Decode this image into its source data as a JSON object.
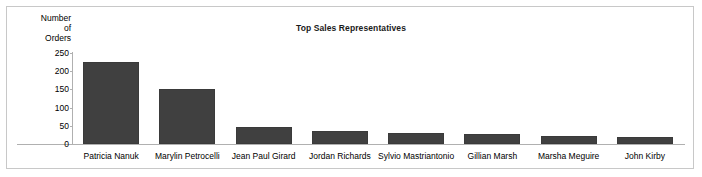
{
  "chart_data": {
    "type": "bar",
    "title": "Top Sales Representatives",
    "xlabel": "",
    "ylabel": "Number of Orders",
    "ylabel_lines": [
      "Number",
      "of",
      "Orders"
    ],
    "categories": [
      "Patricia Nanuk",
      "Marylin Petrocelli",
      "Jean Paul Girard",
      "Jordan Richards",
      "Sylvio Mastriantonio",
      "Gillian Marsh",
      "Marsha Meguire",
      "John Kirby"
    ],
    "values": [
      225,
      150,
      48,
      35,
      30,
      27,
      23,
      18
    ],
    "ylim": [
      0,
      250
    ],
    "yticks": [
      0,
      50,
      100,
      150,
      200,
      250
    ],
    "ytick_labels": [
      "0",
      "50",
      "100",
      "150",
      "200",
      "250"
    ],
    "grid": false,
    "legend": false,
    "bar_color": "#404040",
    "axis_color": "#b0b0b0",
    "frame_color": "#c8c8c8",
    "background": "#ffffff"
  }
}
